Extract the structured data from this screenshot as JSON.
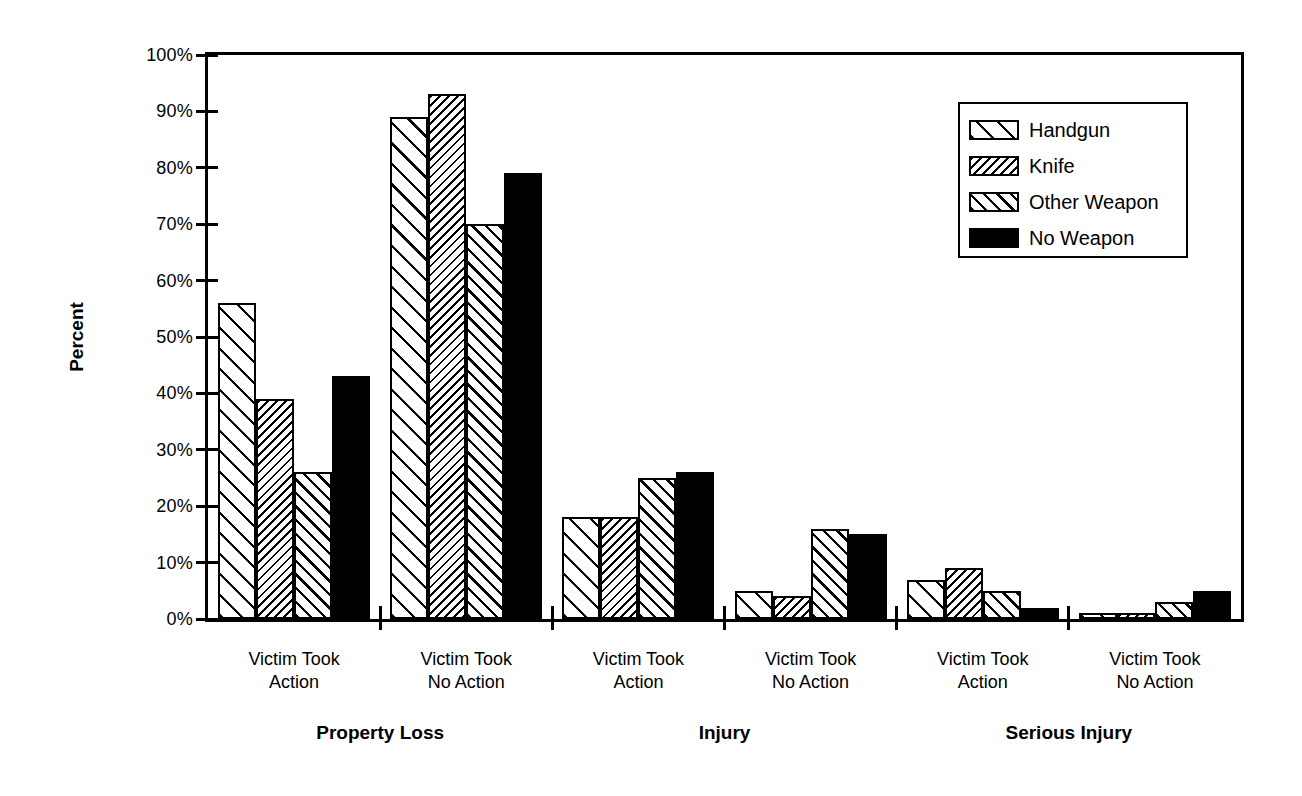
{
  "figure": {
    "background": "#ffffff",
    "ink_color": "#000000"
  },
  "chart_data": {
    "type": "bar",
    "title": "",
    "ylabel": "Percent",
    "xlabel": "",
    "ylim": [
      0,
      100
    ],
    "grid": false,
    "ytick_labels": [
      "0%",
      "10%",
      "20%",
      "30%",
      "40%",
      "50%",
      "60%",
      "70%",
      "80%",
      "90%",
      "100%"
    ],
    "categories": [
      {
        "line1": "Victim Took",
        "line2": "Action",
        "section": "Property Loss"
      },
      {
        "line1": "Victim Took",
        "line2": "No Action",
        "section": "Property Loss"
      },
      {
        "line1": "Victim Took",
        "line2": "Action",
        "section": "Injury"
      },
      {
        "line1": "Victim Took",
        "line2": "No Action",
        "section": "Injury"
      },
      {
        "line1": "Victim Took",
        "line2": "Action",
        "section": "Serious Injury"
      },
      {
        "line1": "Victim Took",
        "line2": "No Action",
        "section": "Serious Injury"
      }
    ],
    "sections": [
      "Property Loss",
      "Injury",
      "Serious Injury"
    ],
    "series": [
      {
        "name": "Handgun",
        "hatch": "backslash-wide",
        "values": [
          56,
          89,
          18,
          5,
          7,
          1
        ]
      },
      {
        "name": "Knife",
        "hatch": "slash-fine",
        "values": [
          39,
          93,
          18,
          4,
          9,
          1
        ]
      },
      {
        "name": "Other Weapon",
        "hatch": "backslash-medium",
        "values": [
          26,
          70,
          25,
          16,
          5,
          3
        ]
      },
      {
        "name": "No Weapon",
        "hatch": "solid",
        "values": [
          43,
          79,
          26,
          15,
          2,
          5
        ]
      }
    ],
    "legend": {
      "position": "top-right",
      "entries": [
        "Handgun",
        "Knife",
        "Other Weapon",
        "No Weapon"
      ]
    }
  }
}
